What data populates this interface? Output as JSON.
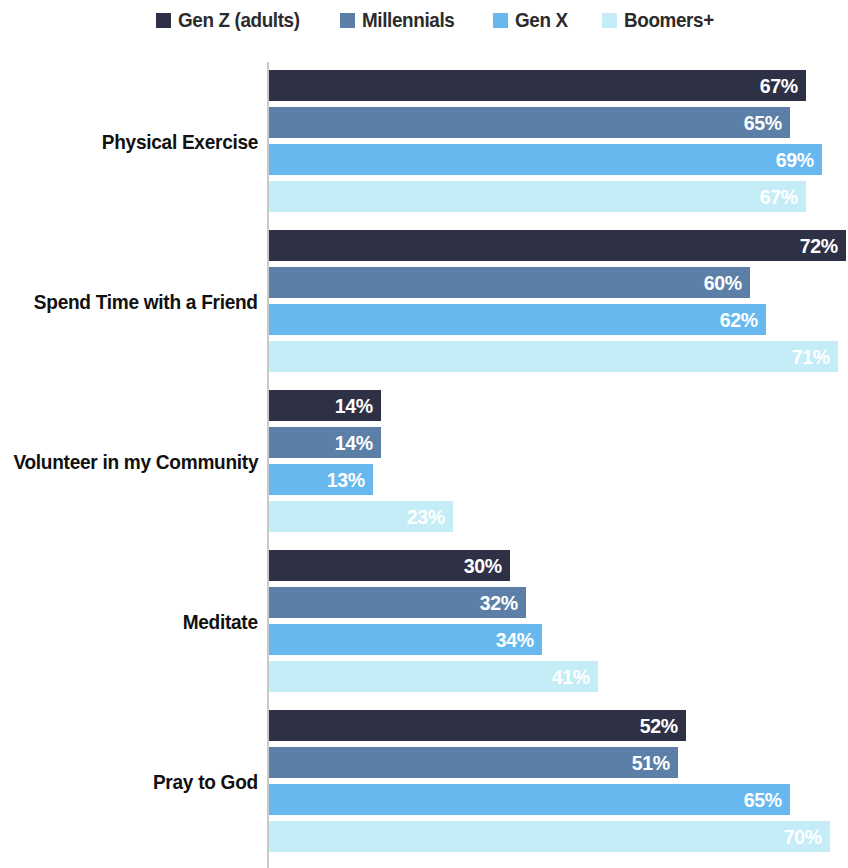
{
  "legend": {
    "items": [
      {
        "label": "Gen Z (adults)",
        "color": "#2e3145",
        "swatch_icon": "square-swatch-icon"
      },
      {
        "label": "Millennials",
        "color": "#5b7fa6",
        "swatch_icon": "square-swatch-icon"
      },
      {
        "label": "Gen X",
        "color": "#66b8ee",
        "swatch_icon": "square-swatch-icon"
      },
      {
        "label": "Boomers+",
        "color": "#c5edf8",
        "swatch_icon": "square-swatch-icon"
      }
    ]
  },
  "chart_data": {
    "type": "bar",
    "orientation": "horizontal",
    "title": "",
    "subtitle": "",
    "xlabel": "",
    "ylabel": "",
    "xlim": [
      0,
      72
    ],
    "grid": false,
    "legend_position": "top",
    "value_suffix": "%",
    "categories": [
      "Physical Exercise",
      "Spend Time with a Friend",
      "Volunteer in my Community",
      "Meditate",
      "Pray to God"
    ],
    "series": [
      {
        "name": "Gen Z (adults)",
        "color": "#2e3145",
        "values": [
          67,
          72,
          14,
          30,
          52
        ],
        "labels": [
          "67%",
          "72%",
          "14%",
          "30%",
          "52%"
        ]
      },
      {
        "name": "Millennials",
        "color": "#5b7fa6",
        "values": [
          65,
          60,
          14,
          32,
          51
        ],
        "labels": [
          "65%",
          "60%",
          "14%",
          "32%",
          "51%"
        ]
      },
      {
        "name": "Gen X",
        "color": "#66b8ee",
        "values": [
          69,
          62,
          13,
          34,
          65
        ],
        "labels": [
          "69%",
          "62%",
          "13%",
          "34%",
          "65%"
        ]
      },
      {
        "name": "Boomers+",
        "color": "#c5edf8",
        "values": [
          67,
          71,
          23,
          41,
          70
        ],
        "labels": [
          "67%",
          "71%",
          "23%",
          "41%",
          "70%"
        ]
      }
    ]
  }
}
